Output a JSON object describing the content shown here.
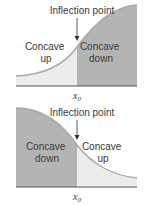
{
  "colors": {
    "dark_fill": "#b4b4b4",
    "light_fill": "#ececec",
    "curve": "#a8a8a8",
    "axis": "#555555",
    "text": "#3a3a3a"
  },
  "top_panel": {
    "title": "Inflection point",
    "left_region": [
      "Concave",
      "up"
    ],
    "right_region": [
      "Concave",
      "down"
    ],
    "x_label": "x",
    "x_sub": "0"
  },
  "bottom_panel": {
    "title": "Inflection point",
    "left_region": [
      "Concave",
      "down"
    ],
    "right_region": [
      "Concave",
      "up"
    ],
    "x_label": "x",
    "x_sub": "0"
  }
}
